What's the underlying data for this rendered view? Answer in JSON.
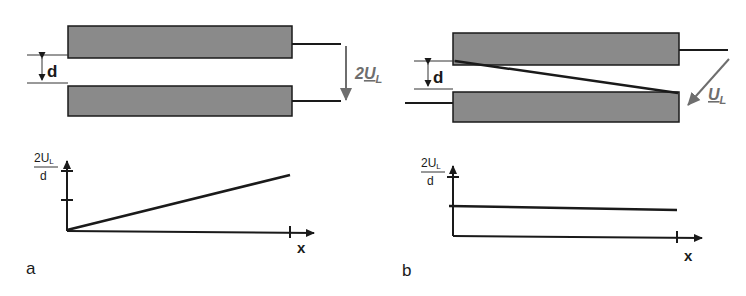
{
  "panel_a": {
    "label": "a",
    "gap_label": "d",
    "voltage_label_prefix": "2",
    "voltage_label_main": "U",
    "voltage_label_sub": "L",
    "graph": {
      "y_label_num": "2U",
      "y_label_sub": "L",
      "y_label_den": "d",
      "x_label": "x",
      "curve": "linear increasing from origin"
    }
  },
  "panel_b": {
    "label": "b",
    "gap_label": "d",
    "voltage_label_main": "U",
    "voltage_label_sub": "L",
    "graph": {
      "y_label_num": "2U",
      "y_label_sub": "L",
      "y_label_den": "d",
      "x_label": "x",
      "curve": "constant, approximately half of 2U_L/d"
    }
  },
  "colors": {
    "plate_fill": "#8a8a8a",
    "line": "#1a1a1a",
    "voltage_arrow": "#6e6e6e"
  }
}
